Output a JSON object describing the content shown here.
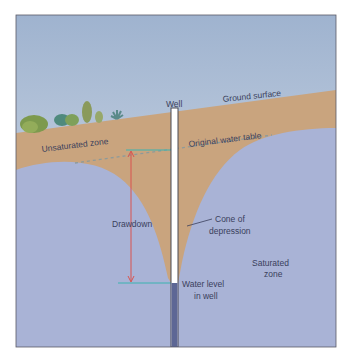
{
  "diagram": {
    "type": "cross-section",
    "colors": {
      "sky_top": "#9fb3cf",
      "sky_bottom": "#d7e0ea",
      "soil": "#c9a47e",
      "groundwater": "#a9b3d6",
      "well_casing": "#ffffff",
      "well_water": "#5d6795",
      "frame": "#5a5a66",
      "drawdown_arrow": "#d9534f",
      "water_level_line": "#3bb3b0",
      "label_text": "#3a3f5c"
    },
    "labels": {
      "well": "Well",
      "ground_surface": "Ground surface",
      "unsaturated_zone": "Unsaturated zone",
      "original_water_table": "Original water table",
      "drawdown": "Drawdown",
      "cone_line1": "Cone of",
      "cone_line2": "depression",
      "saturated_line1": "Saturated",
      "saturated_line2": "zone",
      "water_level_line1": "Water level",
      "water_level_line2": "in well"
    }
  }
}
